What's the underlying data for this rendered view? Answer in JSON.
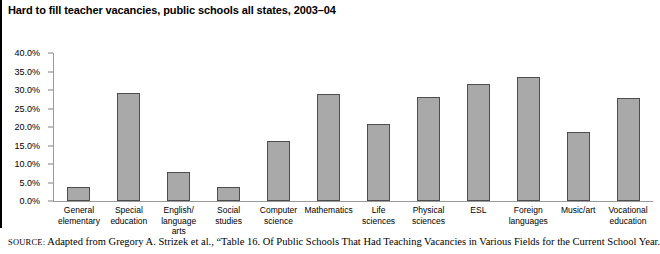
{
  "chart_data": {
    "type": "bar",
    "title": "Hard to fill teacher vacancies, public schools all states, 2003–04",
    "xlabel": "",
    "ylabel": "",
    "ylim": [
      0,
      40
    ],
    "grid": false,
    "legend": "none",
    "y_tick_labels": [
      "40.0%",
      "35.0%",
      "30.0%",
      "25.0%",
      "20.0%",
      "15.0%",
      "10.0%",
      "5.0%",
      "0.0%"
    ],
    "y_ticks": [
      40,
      35,
      30,
      25,
      20,
      15,
      10,
      5,
      0
    ],
    "categories": [
      "General elementary",
      "Special education",
      "English/ language arts",
      "Social studies",
      "Computer science",
      "Mathematics",
      "Life sciences",
      "Physical sciences",
      "ESL",
      "Foreign languages",
      "Music/art",
      "Vocational education"
    ],
    "category_lines": [
      [
        "General",
        "elementary"
      ],
      [
        "Special",
        "education"
      ],
      [
        "English/",
        "language arts"
      ],
      [
        "Social",
        "studies"
      ],
      [
        "Computer",
        "science"
      ],
      [
        "Mathematics",
        ""
      ],
      [
        "Life",
        "sciences"
      ],
      [
        "Physical",
        "sciences"
      ],
      [
        "ESL",
        ""
      ],
      [
        "Foreign",
        "languages"
      ],
      [
        "Music/art",
        ""
      ],
      [
        "Vocational",
        "education"
      ]
    ],
    "values": [
      3.8,
      29.3,
      7.8,
      3.9,
      16.2,
      28.8,
      20.7,
      28.0,
      31.5,
      33.5,
      18.7,
      27.8
    ],
    "bar_color": "#a9a9a9",
    "bar_border_color": "#4d4d4d",
    "axis_color": "#9a9a9a"
  },
  "source": {
    "label": "SOURCE:",
    "text": " Adapted from Gregory A. Strizek et al., “Table 16. Of Public Schools That Had Teaching Vacancies in Various Fields for the Current School Year."
  }
}
